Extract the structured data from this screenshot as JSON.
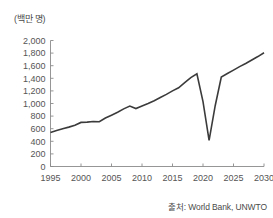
{
  "figure": {
    "y_axis_title": "(백만 명)",
    "source_note": "출처: World Bank, UNWTO"
  },
  "chart_data": {
    "type": "line",
    "title": "",
    "subtitle": "",
    "xlabel": "",
    "ylabel": "(백만 명)",
    "xlim": [
      1995,
      2030
    ],
    "ylim": [
      0,
      2000
    ],
    "grid": false,
    "legend": false,
    "legend_position": "none",
    "line_color": "#3b3b3b",
    "xticks": [
      1995,
      2000,
      2005,
      2010,
      2015,
      2020,
      2025,
      2030
    ],
    "xtick_labels": [
      "1995",
      "2000",
      "2005",
      "2010",
      "2015",
      "2020",
      "2025",
      "2030"
    ],
    "yticks": [
      0,
      200,
      400,
      600,
      800,
      1000,
      1200,
      1400,
      1600,
      1800,
      2000
    ],
    "ytick_labels": [
      "0",
      "200",
      "400",
      "600",
      "800",
      "1,000",
      "1,200",
      "1,400",
      "1,600",
      "1,800",
      "2,000"
    ],
    "series": [
      {
        "name": "International tourist arrivals",
        "x": [
          1995,
          1996,
          1997,
          1998,
          1999,
          2000,
          2001,
          2002,
          2003,
          2004,
          2005,
          2006,
          2007,
          2008,
          2009,
          2010,
          2011,
          2012,
          2013,
          2014,
          2015,
          2016,
          2017,
          2018,
          2019,
          2020,
          2021,
          2022,
          2023,
          2024,
          2025,
          2026,
          2027,
          2028,
          2029,
          2030
        ],
        "values": [
          540,
          570,
          600,
          625,
          655,
          700,
          705,
          715,
          710,
          770,
          815,
          860,
          915,
          960,
          920,
          960,
          1000,
          1045,
          1095,
          1145,
          1200,
          1250,
          1330,
          1410,
          1470,
          1030,
          415,
          965,
          1420,
          1475,
          1530,
          1585,
          1635,
          1690,
          1745,
          1805
        ]
      }
    ],
    "annotations": [
      {
        "label": "2009 global financial crisis dip",
        "x": 2009,
        "y": 920
      },
      {
        "label": "2020-2021 COVID-19 collapse",
        "x": 2021,
        "y": 415
      },
      {
        "label": "2023 recovery",
        "x": 2023,
        "y": 1420
      },
      {
        "label": "2030 projection",
        "x": 2030,
        "y": 1805
      }
    ]
  }
}
